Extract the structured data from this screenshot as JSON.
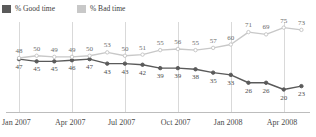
{
  "legend": {
    "position": "top-left",
    "items": [
      {
        "label": "% Good time",
        "color": "#5a5a5a",
        "key": "good"
      },
      {
        "label": "% Bad time",
        "color": "#c8c8c8",
        "key": "bad"
      }
    ]
  },
  "axis": {
    "ticks": [
      "Jan 2007",
      "Apr 2007",
      "Jul 2007",
      "Oct 2007",
      "Jan 2008",
      "Apr 2008"
    ]
  },
  "chart_data": {
    "type": "line",
    "title": "",
    "subtitle": "",
    "xlabel": "",
    "ylabel": "",
    "ylim": [
      0,
      80
    ],
    "grid": true,
    "legend_position": "top-left",
    "x": [
      "Jan 2007",
      "Feb 2007",
      "Mar 2007",
      "Apr 2007",
      "May 2007",
      "Jun 2007",
      "Jul 2007",
      "Aug 2007",
      "Sep 2007",
      "Oct 2007",
      "Nov 2007",
      "Dec 2007",
      "Jan 2008",
      "Feb 2008",
      "Mar 2008",
      "Apr 2008",
      "May 2008"
    ],
    "categories": [
      "Jan 2007",
      "Feb 2007",
      "Mar 2007",
      "Apr 2007",
      "May 2007",
      "Jun 2007",
      "Jul 2007",
      "Aug 2007",
      "Sep 2007",
      "Oct 2007",
      "Nov 2007",
      "Dec 2007",
      "Jan 2008",
      "Feb 2008",
      "Mar 2008",
      "Apr 2008",
      "May 2008"
    ],
    "xtick_labels": [
      "Jan 2007",
      "Apr 2007",
      "Jul 2007",
      "Oct 2007",
      "Jan 2008",
      "Apr 2008"
    ],
    "xtick_indices": [
      0,
      3,
      6,
      9,
      12,
      15
    ],
    "series": [
      {
        "name": "% Good time",
        "key": "good",
        "color": "#5a5a5a",
        "values": [
          47,
          45,
          45,
          46,
          47,
          43,
          43,
          42,
          39,
          39,
          38,
          35,
          33,
          26,
          26,
          20,
          23
        ]
      },
      {
        "name": "% Bad time",
        "key": "bad",
        "color": "#c8c8c8",
        "values": [
          48,
          50,
          49,
          49,
          50,
          53,
          50,
          51,
          55,
          56,
          55,
          57,
          60,
          71,
          69,
          75,
          73
        ]
      }
    ]
  }
}
